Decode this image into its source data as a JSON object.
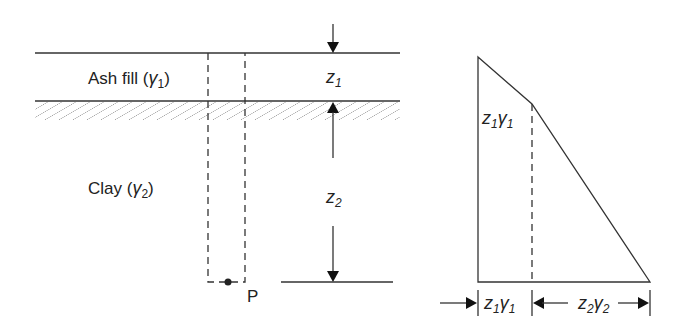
{
  "profile": {
    "layers": [
      {
        "name": "Ash fill",
        "unit_weight_symbol": "γ",
        "unit_weight_subscript": "1",
        "thickness_symbol": "z",
        "thickness_subscript": "1"
      },
      {
        "name": "Clay",
        "unit_weight_symbol": "γ",
        "unit_weight_subscript": "2",
        "thickness_symbol": "z",
        "thickness_subscript": "2"
      }
    ],
    "point_label": "P"
  },
  "stress_diagram": {
    "break_label": {
      "a": "z",
      "a_sub": "1",
      "b": "γ",
      "b_sub": "1"
    },
    "dim_1": {
      "a": "z",
      "a_sub": "1",
      "b": "γ",
      "b_sub": "1"
    },
    "dim_2": {
      "a": "z",
      "a_sub": "2",
      "b": "γ",
      "b_sub": "2"
    }
  }
}
